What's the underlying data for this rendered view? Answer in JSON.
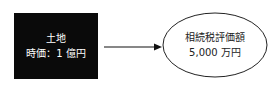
{
  "source": {
    "line1": "土地",
    "line2": "時価：1 億円",
    "fill": "#0a0a0a"
  },
  "target": {
    "line1": "相続税評価額",
    "line2": "5,000 万円"
  }
}
